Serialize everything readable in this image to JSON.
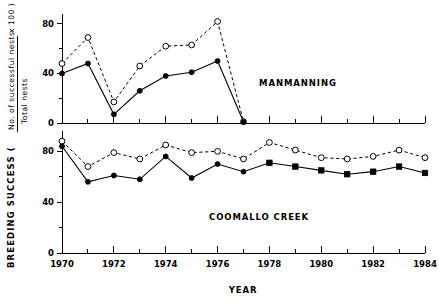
{
  "chart_data": {
    "type": "line",
    "title": "",
    "xlabel": "YEAR",
    "ylabel": "BREEDING SUCCESS ( No. of successful nests / Total nests x 100 )",
    "ylabel_parts": {
      "prefix": "BREEDING  SUCCESS  (",
      "numerator": "No.  of  successful  nests",
      "denominator": "Total  nests",
      "suffix": "x  100 )"
    },
    "x": [
      1970,
      1971,
      1972,
      1973,
      1974,
      1975,
      1976,
      1977,
      1978,
      1979,
      1980,
      1981,
      1982,
      1983,
      1984
    ],
    "xlim": [
      1970,
      1984
    ],
    "xticks": [
      1970,
      1971,
      1972,
      1973,
      1974,
      1975,
      1976,
      1977,
      1978,
      1979,
      1980,
      1981,
      1982,
      1983,
      1984
    ],
    "xticklabels": [
      "1970",
      "",
      "1972",
      "",
      "1974",
      "",
      "1976",
      "",
      "1978",
      "",
      "1980",
      "",
      "1982",
      "",
      "1984"
    ],
    "grid": false,
    "legend": "none",
    "panels": [
      {
        "name": "MANMANNING",
        "label": "MANMANNING",
        "label_x": 1979.1,
        "label_y": 30,
        "ylim": [
          0,
          88
        ],
        "yticks": [
          0,
          20,
          40,
          60,
          80
        ],
        "yticklabels": [
          "0",
          "",
          "40",
          "",
          "80"
        ],
        "series": [
          {
            "name": "total nests (open circles)",
            "marker": "open-circle",
            "linestyle": "dashed",
            "x": [
              1970,
              1971,
              1972,
              1973,
              1974,
              1975,
              1976,
              1977
            ],
            "values": [
              48,
              69,
              17,
              46,
              62,
              63,
              82,
              1
            ]
          },
          {
            "name": "successful nests (filled circles)",
            "marker": "filled-circle",
            "linestyle": "solid",
            "x": [
              1970,
              1971,
              1972,
              1973,
              1974,
              1975,
              1976,
              1977
            ],
            "values": [
              40,
              48,
              7,
              26,
              38,
              41,
              50,
              1
            ]
          }
        ]
      },
      {
        "name": "COOMALLO CREEK",
        "label": "COOMALLO  CREEK",
        "label_x": 1977.6,
        "label_y": 26,
        "ylim": [
          0,
          96
        ],
        "yticks": [
          0,
          20,
          40,
          60,
          80
        ],
        "yticklabels": [
          "0",
          "",
          "40",
          "",
          "80"
        ],
        "series": [
          {
            "name": "total nests (open circles)",
            "marker": "open-circle",
            "linestyle": "dashed",
            "x": [
              1970,
              1971,
              1972,
              1973,
              1974,
              1975,
              1976,
              1977,
              1978,
              1979,
              1980,
              1981,
              1982,
              1983,
              1984
            ],
            "values": [
              88,
              68,
              79,
              74,
              85,
              79,
              80,
              74,
              87,
              81,
              75,
              74,
              76,
              81,
              75
            ]
          },
          {
            "name": "successful nests (filled markers)",
            "marker": "filled-circle-then-square",
            "marker_switch_year": 1977,
            "linestyle": "solid",
            "x": [
              1970,
              1971,
              1972,
              1973,
              1974,
              1975,
              1976,
              1977,
              1978,
              1979,
              1980,
              1981,
              1982,
              1983,
              1984
            ],
            "values": [
              84,
              56,
              61,
              58,
              76,
              59,
              70,
              64,
              71,
              68,
              65,
              62,
              64,
              68,
              63
            ]
          }
        ]
      }
    ]
  },
  "axis": {
    "x_title": "YEAR"
  }
}
